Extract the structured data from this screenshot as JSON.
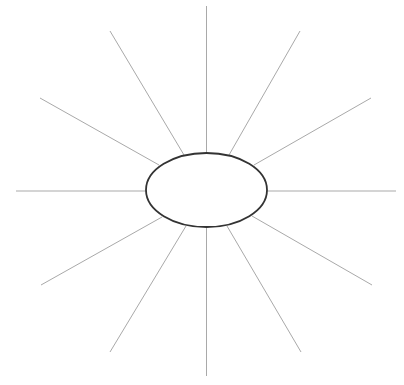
{
  "diagram": {
    "type": "spider-map",
    "canvas": {
      "width": 404,
      "height": 385,
      "background": "#ffffff"
    },
    "center_node": {
      "shape": "ellipse",
      "cx": 206.5,
      "cy": 190,
      "rx": 60.5,
      "ry": 37,
      "stroke": "#333333",
      "fill": "#ffffff",
      "label": ""
    },
    "spoke_color": "#a9a9a9",
    "spokes": [
      {
        "id": "top",
        "x1": 206.5,
        "y1": 153,
        "x2": 206.5,
        "y2": 6
      },
      {
        "id": "top-right-steep",
        "x1": 229,
        "y1": 155,
        "x2": 300,
        "y2": 31
      },
      {
        "id": "top-right-shallow",
        "x1": 254,
        "y1": 165,
        "x2": 371,
        "y2": 98
      },
      {
        "id": "right",
        "x1": 267,
        "y1": 191,
        "x2": 396,
        "y2": 191
      },
      {
        "id": "bottom-right-shallow",
        "x1": 252,
        "y1": 216,
        "x2": 372,
        "y2": 285
      },
      {
        "id": "bottom-right-steep",
        "x1": 227,
        "y1": 226,
        "x2": 301,
        "y2": 352
      },
      {
        "id": "bottom",
        "x1": 206.5,
        "y1": 227,
        "x2": 206.5,
        "y2": 376
      },
      {
        "id": "bottom-left-steep",
        "x1": 186,
        "y1": 226,
        "x2": 110,
        "y2": 352
      },
      {
        "id": "bottom-left-shallow",
        "x1": 162,
        "y1": 217,
        "x2": 41,
        "y2": 285
      },
      {
        "id": "left",
        "x1": 146,
        "y1": 191,
        "x2": 16,
        "y2": 191
      },
      {
        "id": "top-left-shallow",
        "x1": 159,
        "y1": 165,
        "x2": 40,
        "y2": 98
      },
      {
        "id": "top-left-steep",
        "x1": 184,
        "y1": 155,
        "x2": 110,
        "y2": 31
      }
    ]
  }
}
